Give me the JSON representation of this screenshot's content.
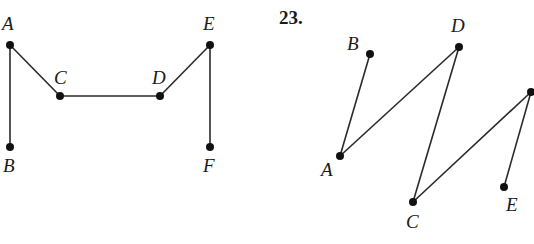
{
  "colors": {
    "stroke": "#2a2a2a",
    "node": "#111111",
    "text": "#1a1a1a",
    "background": "#ffffff"
  },
  "problem_number": "23.",
  "graphs": [
    {
      "id": "graph-left",
      "nodes": [
        {
          "id": "A",
          "label": "A",
          "x": 10,
          "y": 45,
          "lx": 2,
          "ly": 30
        },
        {
          "id": "C",
          "label": "C",
          "x": 60,
          "y": 96,
          "lx": 54,
          "ly": 84
        },
        {
          "id": "D",
          "label": "D",
          "x": 160,
          "y": 96,
          "lx": 152,
          "ly": 84
        },
        {
          "id": "E",
          "label": "E",
          "x": 210,
          "y": 45,
          "lx": 203,
          "ly": 30
        },
        {
          "id": "B",
          "label": "B",
          "x": 10,
          "y": 147,
          "lx": 3,
          "ly": 172
        },
        {
          "id": "F",
          "label": "F",
          "x": 210,
          "y": 147,
          "lx": 203,
          "ly": 172
        }
      ],
      "edges": [
        [
          "A",
          "B"
        ],
        [
          "A",
          "C"
        ],
        [
          "C",
          "D"
        ],
        [
          "D",
          "E"
        ],
        [
          "E",
          "F"
        ]
      ]
    },
    {
      "id": "graph-right",
      "nodes": [
        {
          "id": "B",
          "label": "B",
          "x": 370,
          "y": 54,
          "lx": 347,
          "ly": 50
        },
        {
          "id": "D",
          "label": "D",
          "x": 459,
          "y": 47,
          "lx": 451,
          "ly": 32
        },
        {
          "id": "R",
          "label": "",
          "x": 531,
          "y": 92,
          "lx": 0,
          "ly": 0
        },
        {
          "id": "A",
          "label": "A",
          "x": 340,
          "y": 156,
          "lx": 321,
          "ly": 176
        },
        {
          "id": "C",
          "label": "C",
          "x": 413,
          "y": 202,
          "lx": 406,
          "ly": 228
        },
        {
          "id": "E",
          "label": "E",
          "x": 504,
          "y": 187,
          "lx": 506,
          "ly": 211
        }
      ],
      "edges": [
        [
          "A",
          "B"
        ],
        [
          "A",
          "D"
        ],
        [
          "D",
          "C"
        ],
        [
          "C",
          "R"
        ],
        [
          "R",
          "E"
        ]
      ]
    }
  ]
}
